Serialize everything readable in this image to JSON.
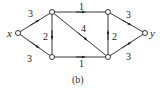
{
  "diagram": {
    "type": "directed-network",
    "caption": "(b)",
    "nodes": [
      {
        "id": "x",
        "label": "x",
        "cx": 18,
        "cy": 33
      },
      {
        "id": "a",
        "label": "",
        "cx": 52,
        "cy": 12
      },
      {
        "id": "b",
        "label": "",
        "cx": 52,
        "cy": 57
      },
      {
        "id": "c",
        "label": "",
        "cx": 108,
        "cy": 12
      },
      {
        "id": "d",
        "label": "",
        "cx": 108,
        "cy": 57
      },
      {
        "id": "y",
        "label": "y",
        "cx": 145,
        "cy": 33
      }
    ],
    "edges": [
      {
        "from": "x",
        "to": "a",
        "weight": "3"
      },
      {
        "from": "x",
        "to": "b",
        "weight": "3"
      },
      {
        "from": "a",
        "to": "b",
        "weight": "2"
      },
      {
        "from": "a",
        "to": "c",
        "weight": "1"
      },
      {
        "from": "a",
        "to": "d",
        "weight": "4"
      },
      {
        "from": "b",
        "to": "d",
        "weight": "1"
      },
      {
        "from": "d",
        "to": "c",
        "weight": "2"
      },
      {
        "from": "c",
        "to": "y",
        "weight": "3"
      },
      {
        "from": "d",
        "to": "y",
        "weight": "3"
      }
    ]
  }
}
